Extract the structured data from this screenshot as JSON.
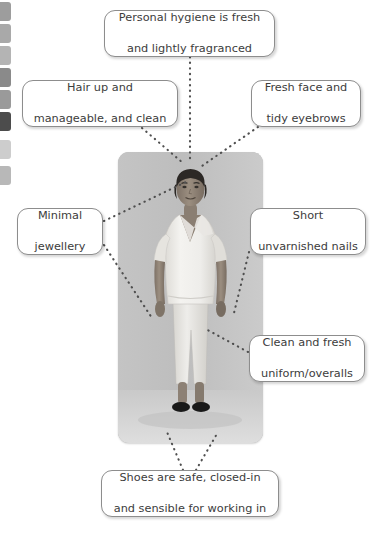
{
  "page": {
    "background_color": "#ffffff"
  },
  "tab_strip": {
    "name": "chapter-tabs",
    "tabs": [
      {
        "label": "",
        "color": "#9d9d9d",
        "top": 2
      },
      {
        "label": "",
        "color": "#a9a9a9",
        "top": 24
      },
      {
        "label": "",
        "color": "#b4b4b4",
        "top": 46
      },
      {
        "label": "",
        "color": "#8a8a8a",
        "top": 68
      },
      {
        "label": "",
        "color": "#9a9a9a",
        "top": 90
      },
      {
        "label": "",
        "color": "#4c4c4c",
        "top": 112
      },
      {
        "label": "",
        "color": "#cdcdcd",
        "top": 140
      },
      {
        "label": "",
        "color": "#b8b8b8",
        "top": 166
      }
    ]
  },
  "photo": {
    "alt": "Woman standing in a white short-sleeved tunic uniform, white trousers and black closed-in shoes against a plain grey background",
    "subject": "healthcare-worker",
    "tones": {
      "background": "#bfbfbf",
      "floor": "#d2d2d2",
      "uniform": "#f2f1ee",
      "skin": "#8f8377",
      "hair": "#2f2b28",
      "shoes": "#1a1a1a"
    }
  },
  "callouts": [
    {
      "id": "hygiene",
      "name": "callout-personal-hygiene",
      "line1": "Personal hygiene is fresh",
      "line2": "and lightly fragranced",
      "text": "Personal hygiene is fresh and lightly fragranced"
    },
    {
      "id": "hair",
      "name": "callout-hair",
      "line1": "Hair up and",
      "line2": "manageable, and clean",
      "text": "Hair up and manageable, and clean"
    },
    {
      "id": "face",
      "name": "callout-face",
      "line1": "Fresh face and",
      "line2": "tidy eyebrows",
      "text": "Fresh face and tidy eyebrows"
    },
    {
      "id": "jewel",
      "name": "callout-jewellery",
      "line1": "Minimal",
      "line2": "jewellery",
      "text": "Minimal jewellery"
    },
    {
      "id": "nails",
      "name": "callout-nails",
      "line1": "Short",
      "line2": "unvarnished nails",
      "text": "Short unvarnished nails"
    },
    {
      "id": "uniform",
      "name": "callout-uniform",
      "line1": "Clean and fresh",
      "line2": "uniform/overalls",
      "text": "Clean and fresh uniform/overalls"
    },
    {
      "id": "shoes",
      "name": "callout-shoes",
      "line1": "Shoes are safe, closed-in",
      "line2": "and sensible for working in",
      "text": "Shoes are safe, closed-in and sensible for working in"
    }
  ],
  "connectors": {
    "style": "dotted",
    "color": "#4f4f4f",
    "lines": [
      {
        "from": "callout-personal-hygiene",
        "to": "head-top",
        "x1": 190,
        "y1": 57,
        "x2": 190,
        "y2": 162
      },
      {
        "from": "callout-hair",
        "to": "head-hair",
        "x1": 142,
        "y1": 128,
        "x2": 183,
        "y2": 163
      },
      {
        "from": "callout-face",
        "to": "face",
        "x1": 258,
        "y1": 127,
        "x2": 199,
        "y2": 168
      },
      {
        "from": "callout-jewellery",
        "to": "neck",
        "x1": 104,
        "y1": 221,
        "x2": 186,
        "y2": 182
      },
      {
        "from": "callout-jewellery",
        "to": "left-hand",
        "x1": 104,
        "y1": 245,
        "x2": 152,
        "y2": 318
      },
      {
        "from": "callout-nails",
        "to": "right-hand",
        "x1": 249,
        "y1": 252,
        "x2": 233,
        "y2": 317
      },
      {
        "from": "callout-uniform",
        "to": "tunic",
        "x1": 248,
        "y1": 352,
        "x2": 204,
        "y2": 328
      },
      {
        "from": "callout-shoes",
        "to": "left-shoe",
        "x1": 183,
        "y1": 470,
        "x2": 167,
        "y2": 432
      },
      {
        "from": "callout-shoes",
        "to": "right-shoe",
        "x1": 196,
        "y1": 470,
        "x2": 218,
        "y2": 432
      }
    ]
  }
}
